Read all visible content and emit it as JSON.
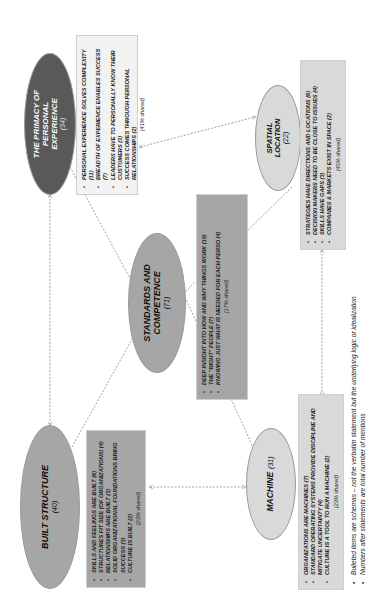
{
  "diagram": {
    "nodes": {
      "personal": {
        "title": "THE PRIMACY OF PERSONAL EXPERIENCE",
        "count": "(34)",
        "fill": "#595959",
        "text_color": "#ffffff",
        "items": [
          "Personal experience solves complexity (11)",
          "Breadth of experience enables success (7)",
          "Leaders have to personally know their customers (3)",
          "Success comes through personal relationships (2)"
        ],
        "shared": "(41% shared)",
        "box_fill": "#f2f2f2"
      },
      "built": {
        "title": "BUILT STRUCTURE",
        "count": "(40)",
        "fill": "#a6a6a6",
        "text_color": "#111111",
        "items": [
          "Skills and feelings are built (6)",
          "Structures fit size (of organizations) (4)",
          "Relationships are built (3)",
          "Solid organizational foundations bring success (3)",
          "Culture is built (2)"
        ],
        "shared": "(23% shared)",
        "box_fill": "#a6a6a6"
      },
      "standards": {
        "title": "STANDARDS AND COMPETENCE",
        "count": "(71)",
        "fill": "#a6a6a6",
        "text_color": "#111111",
        "items": [
          "Deep insight into how and why things work (19)",
          "The \"right\" people (7)",
          "Knowing just what is needed for each perso (4)"
        ],
        "shared": "(17% shared)",
        "box_fill": "#a6a6a6"
      },
      "machine": {
        "title": "MACHINE",
        "count": "(31)",
        "fill": "#d9d9d9",
        "text_color": "#111111",
        "items": [
          "Organizations are machines (7)",
          "Standard operating systems provide discipline and mitigate uncertainty (4)",
          "Culture is a tool to run a machine (2)"
        ],
        "shared": "(23% shared)",
        "box_fill": "#d9d9d9"
      },
      "spatial": {
        "title": "SPATIAL LOCATION",
        "count": "(22)",
        "fill": "#d9d9d9",
        "text_color": "#111111",
        "items": [
          "Strategies have directions and locations (6)",
          "Decision makers need to be close to issues (4)",
          "Skills have gaps (3)",
          "Companies & markets exist in space (2)"
        ],
        "shared": "(45% shared)",
        "box_fill": "#d9d9d9"
      }
    },
    "footnotes": [
      "Bulleted items are schemas – not the verbatim statement but the underlying logic or idealization",
      "Numbers after statements are total number of mentions"
    ],
    "connector_color": "#8c8c8c"
  }
}
